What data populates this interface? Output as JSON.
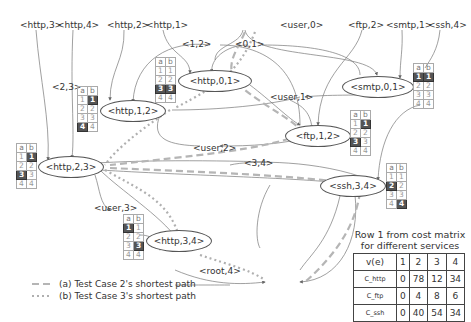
{
  "top_labels": [
    "<http,3>",
    "<http,4>",
    "<http,2>",
    "<http,1>",
    "<user,0>",
    "<ftp,2>",
    "<smtp,1>",
    "<ssh,4>"
  ],
  "edge_labels": {
    "e12": "<1,2>",
    "e01": "<0,1>",
    "e23": "<2,3>",
    "e34": "<3,4>",
    "user1": "<user,1>",
    "user2": "<user,2>",
    "user3": "<user,3>",
    "root4": "<root,4>"
  },
  "nodes": {
    "http01": "<http,0,1>",
    "http12": "<http,1,2>",
    "http23": "<http,2,3>",
    "http34": "<http,3,4>",
    "smtp01": "<smtp,0,1>",
    "ftp12": "<ftp,1,2>",
    "ssh34": "<ssh,3,4>"
  },
  "mini_tables": {
    "header": [
      "a",
      "b"
    ],
    "rows": [
      [
        "1",
        "1"
      ],
      [
        "2",
        "2"
      ],
      [
        "3",
        "3"
      ],
      [
        "4",
        "4"
      ]
    ],
    "http01_highlight": [
      "a3",
      "b3"
    ],
    "http12_highlight": [
      "b1",
      "a4"
    ],
    "http23_highlight": [
      "b1",
      "a3"
    ],
    "http34_highlight": [
      "a1",
      "b3"
    ],
    "smtp01_highlight": [
      "a1",
      "b1"
    ],
    "ftp12_highlight": [
      "b1",
      "a3"
    ],
    "ssh34_highlight": [
      "a2",
      "b4"
    ]
  },
  "cost_matrix": {
    "caption_line1": "Row 1 from cost matrix",
    "caption_line2": "for different services",
    "header": [
      "v(e)",
      "1",
      "2",
      "3",
      "4"
    ],
    "rows": [
      {
        "label": "C_http",
        "values": [
          "0",
          "78",
          "12",
          "34"
        ]
      },
      {
        "label": "C_ftp",
        "values": [
          "0",
          "4",
          "8",
          "6"
        ]
      },
      {
        "label": "C_ssh",
        "values": [
          "0",
          "40",
          "54",
          "34"
        ]
      }
    ]
  },
  "legend": {
    "a": "(a) Test Case 2's shortest path",
    "b": "(b) Test Case 3's shortest path"
  },
  "colors": {
    "edge": "#666666",
    "path_a": "#b5b5b5",
    "path_b": "#b0b0b0",
    "highlight_cell": "#555555"
  }
}
